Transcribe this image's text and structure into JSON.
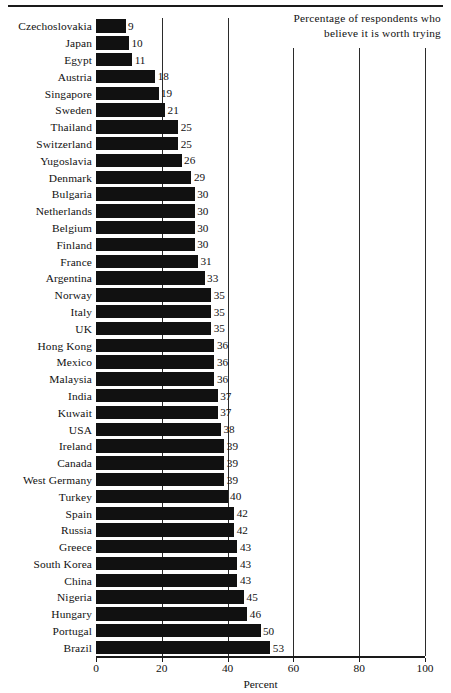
{
  "legend": {
    "line1": "Percentage of respondents who",
    "line2": "believe it is worth trying"
  },
  "axis": {
    "xlabel": "Percent",
    "ticks": [
      "0",
      "20",
      "40",
      "60",
      "80",
      "100"
    ]
  },
  "chart_data": {
    "type": "bar",
    "orientation": "horizontal",
    "title": "Percentage of respondents who believe it is worth trying",
    "xlabel": "Percent",
    "ylabel": "",
    "xlim": [
      0,
      100
    ],
    "xticks": [
      0,
      20,
      40,
      60,
      80,
      100
    ],
    "grid": true,
    "legend_position": "top-right",
    "bar_color": "#111111",
    "categories": [
      "Czechoslovakia",
      "Japan",
      "Egypt",
      "Austria",
      "Singapore",
      "Sweden",
      "Thailand",
      "Switzerland",
      "Yugoslavia",
      "Denmark",
      "Bulgaria",
      "Netherlands",
      "Belgium",
      "Finland",
      "France",
      "Argentina",
      "Norway",
      "Italy",
      "UK",
      "Hong Kong",
      "Mexico",
      "Malaysia",
      "India",
      "Kuwait",
      "USA",
      "Ireland",
      "Canada",
      "West Germany",
      "Turkey",
      "Spain",
      "Russia",
      "Greece",
      "South Korea",
      "China",
      "Nigeria",
      "Hungary",
      "Portugal",
      "Brazil"
    ],
    "values": [
      9,
      10,
      11,
      18,
      19,
      21,
      25,
      25,
      26,
      29,
      30,
      30,
      30,
      30,
      31,
      33,
      35,
      35,
      35,
      36,
      36,
      36,
      37,
      37,
      38,
      39,
      39,
      39,
      40,
      42,
      42,
      43,
      43,
      43,
      45,
      46,
      50,
      53
    ]
  }
}
